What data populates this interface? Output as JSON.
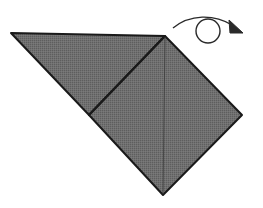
{
  "diagram": {
    "colors": {
      "paper_fill": "#6e6e6e",
      "outline": "#1a1a1a",
      "fold_line": "#3a3a3a",
      "arrow": "#2a2a2a",
      "background": "#ffffff"
    },
    "shapes": {
      "left_flap": {
        "points": [
          [
            11,
            33
          ],
          [
            165,
            36
          ],
          [
            89,
            115
          ]
        ]
      },
      "square": {
        "points": [
          [
            165,
            36
          ],
          [
            242,
            115
          ],
          [
            163,
            195
          ],
          [
            89,
            115
          ]
        ]
      },
      "crease_diagonal": {
        "from": [
          89,
          115
        ],
        "to": [
          165,
          36
        ]
      },
      "center_fold": {
        "from": [
          165,
          36
        ],
        "to": [
          163,
          195
        ]
      }
    },
    "symbols": [
      {
        "name": "turn-over-arrow",
        "meaning": "turn the model over"
      }
    ]
  }
}
